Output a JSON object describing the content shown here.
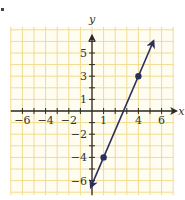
{
  "chart_data": {
    "type": "line",
    "title": "",
    "xlabel": "x",
    "ylabel": "y",
    "xlim": [
      -7,
      7
    ],
    "ylim": [
      -7,
      7
    ],
    "grid": true,
    "x_tick_labels": [
      "-6",
      "-4",
      "-2",
      "1",
      "4",
      "6"
    ],
    "x_tick_values": [
      -6,
      -4,
      -2,
      1,
      4,
      6
    ],
    "y_tick_labels": [
      "5",
      "3",
      "1",
      "-2",
      "-4",
      "-6"
    ],
    "y_tick_values": [
      5,
      3,
      1,
      -2,
      -4,
      -6
    ],
    "series": [
      {
        "name": "line",
        "points": [
          [
            1,
            -4
          ],
          [
            4,
            3
          ]
        ],
        "slope": 2.3333,
        "intercept": -6.3333,
        "arrows": "both",
        "x_range": [
          -0.1,
          5.3
        ]
      }
    ],
    "marked_points": [
      [
        1,
        -4
      ],
      [
        4,
        3
      ]
    ]
  },
  "colors": {
    "grid": "#f0dc90",
    "axis": "#2a2a2a",
    "line": "#2b2f5e",
    "text": "#333333"
  },
  "axes": {
    "x_label": "x",
    "y_label": "y"
  }
}
